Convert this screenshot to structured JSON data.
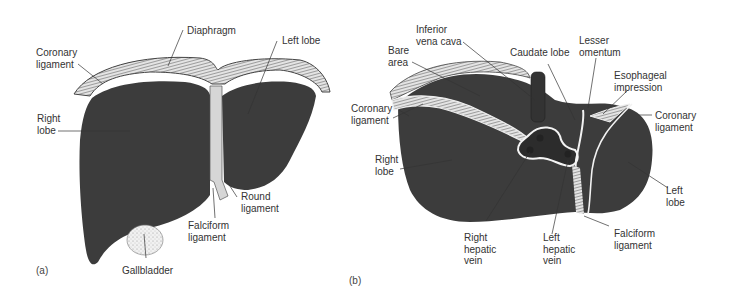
{
  "figure": {
    "colors": {
      "liver": "#3c3c3c",
      "ligament": "#d8d8d8",
      "membrane_light": "#f2f2f2",
      "gallbladder": "#eeeeee",
      "leader_line": "#333333",
      "text": "#333333",
      "background": "#ffffff"
    },
    "panel_a": {
      "tag": "(a)",
      "view": "anterior",
      "labels": {
        "diaphragm": "Diaphragm",
        "coronary_ligament": "Coronary\nligament",
        "left_lobe": "Left lobe",
        "right_lobe": "Right\nlobe",
        "round_ligament": "Round\nligament",
        "falciform_ligament": "Falciform\nligament",
        "gallbladder": "Gallbladder"
      }
    },
    "panel_b": {
      "tag": "(b)",
      "view": "superior",
      "labels": {
        "inferior_vena_cava": "Inferior\nvena cava",
        "bare_area": "Bare\narea",
        "caudate_lobe": "Caudate lobe",
        "lesser_omentum": "Lesser\nomentum",
        "esophageal_impression": "Esophageal\nimpression",
        "coronary_ligament_left": "Coronary\nligament",
        "coronary_ligament_right": "Coronary\nligament",
        "right_lobe": "Right\nlobe",
        "left_lobe": "Left\nlobe",
        "right_hepatic_vein": "Right\nhepatic\nvein",
        "left_hepatic_vein": "Left\nhepatic\nvein",
        "falciform_ligament": "Falciform\nligament"
      }
    }
  }
}
